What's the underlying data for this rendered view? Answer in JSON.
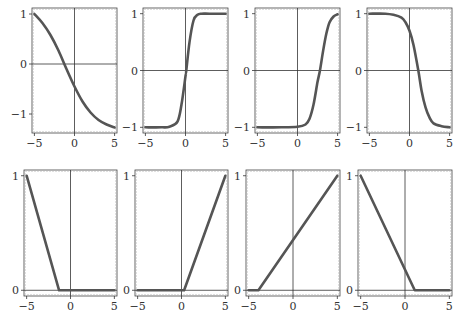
{
  "figure": {
    "rows": 2,
    "cols": 4,
    "line_color": "#555555",
    "axis_color": "#333333",
    "frame_color": "#444444"
  },
  "chart_data": [
    {
      "type": "line",
      "panel": "row1-col1",
      "title": "",
      "xlabel": "",
      "ylabel": "",
      "xlim": [
        -5.3,
        5.3
      ],
      "ylim": [
        -1.38,
        1.12
      ],
      "xticks": [
        -5,
        0,
        5
      ],
      "xtick_labels": [
        "−5",
        "0",
        "5"
      ],
      "yticks": [
        -1,
        0,
        1
      ],
      "ytick_labels": [
        "−1",
        "0",
        "1"
      ],
      "grid": false,
      "x": [
        -5,
        -4,
        -3,
        -2,
        -1,
        0,
        1,
        2,
        3,
        4,
        5
      ],
      "y": [
        1.0,
        0.82,
        0.58,
        0.27,
        -0.1,
        -0.45,
        -0.75,
        -0.97,
        -1.12,
        -1.21,
        -1.27
      ]
    },
    {
      "type": "line",
      "panel": "row1-col2",
      "xlim": [
        -5.3,
        5.3
      ],
      "ylim": [
        -1.1,
        1.1
      ],
      "xticks": [
        -5,
        0,
        5
      ],
      "xtick_labels": [
        "−5",
        "0",
        "5"
      ],
      "yticks": [
        -1,
        0,
        1
      ],
      "ytick_labels": [
        "−1",
        "0",
        "1"
      ],
      "grid": false,
      "x": [
        -5,
        -3,
        -2,
        -1,
        -0.5,
        0,
        0.1,
        0.5,
        1,
        1.5,
        2,
        3,
        5
      ],
      "y": [
        -1.0,
        -1.0,
        -0.99,
        -0.9,
        -0.6,
        -0.1,
        0.0,
        0.5,
        0.88,
        0.98,
        1.0,
        1.0,
        1.0
      ]
    },
    {
      "type": "line",
      "panel": "row1-col3",
      "xlim": [
        -5.3,
        5.3
      ],
      "ylim": [
        -1.1,
        1.1
      ],
      "xticks": [
        -5,
        0,
        5
      ],
      "xtick_labels": [
        "−5",
        "0",
        "5"
      ],
      "yticks": [
        -1,
        0,
        1
      ],
      "ytick_labels": [
        "−1",
        "0",
        "1"
      ],
      "grid": false,
      "x": [
        -5,
        -2,
        0,
        1,
        1.5,
        2,
        2.5,
        2.8,
        3.2,
        3.6,
        4,
        4.5,
        5
      ],
      "y": [
        -1.0,
        -1.0,
        -0.99,
        -0.95,
        -0.85,
        -0.6,
        -0.2,
        0.0,
        0.35,
        0.65,
        0.85,
        0.95,
        0.99
      ]
    },
    {
      "type": "line",
      "panel": "row1-col4",
      "xlim": [
        -5.3,
        5.3
      ],
      "ylim": [
        -1.1,
        1.1
      ],
      "xticks": [
        -5,
        0,
        5
      ],
      "xtick_labels": [
        "−5",
        "0",
        "5"
      ],
      "yticks": [
        -1,
        0,
        1
      ],
      "ytick_labels": [
        "−1",
        "0",
        "1"
      ],
      "grid": false,
      "x": [
        -5,
        -3,
        -2,
        -1,
        -0.5,
        0,
        0.5,
        1.1,
        1.5,
        2,
        2.5,
        3,
        4,
        5
      ],
      "y": [
        1.0,
        1.0,
        0.98,
        0.93,
        0.85,
        0.7,
        0.45,
        0.0,
        -0.35,
        -0.65,
        -0.83,
        -0.93,
        -0.98,
        -1.0
      ]
    },
    {
      "type": "line",
      "panel": "row2-col1",
      "xlim": [
        -5.3,
        5.3
      ],
      "ylim": [
        -0.05,
        1.05
      ],
      "xticks": [
        -5,
        0,
        5
      ],
      "xtick_labels": [
        "−5",
        "0",
        "5"
      ],
      "yticks": [
        0,
        1
      ],
      "ytick_labels": [
        "0",
        "1"
      ],
      "grid": false,
      "x": [
        -5,
        -1.3,
        5
      ],
      "y": [
        1.0,
        0.0,
        0.0
      ]
    },
    {
      "type": "line",
      "panel": "row2-col2",
      "xlim": [
        -5.3,
        5.3
      ],
      "ylim": [
        -0.05,
        1.05
      ],
      "xticks": [
        -5,
        0,
        5
      ],
      "xtick_labels": [
        "−5",
        "0",
        "5"
      ],
      "yticks": [
        0,
        1
      ],
      "ytick_labels": [
        "0",
        "1"
      ],
      "grid": false,
      "x": [
        -5,
        0.3,
        5
      ],
      "y": [
        0.0,
        0.0,
        1.0
      ]
    },
    {
      "type": "line",
      "panel": "row2-col3",
      "xlim": [
        -5.3,
        5.3
      ],
      "ylim": [
        -0.05,
        1.05
      ],
      "xticks": [
        -5,
        0,
        5
      ],
      "xtick_labels": [
        "−5",
        "0",
        "5"
      ],
      "yticks": [
        0,
        1
      ],
      "ytick_labels": [
        "0",
        "1"
      ],
      "grid": false,
      "x": [
        -5,
        -3.9,
        5
      ],
      "y": [
        0.0,
        0.0,
        1.0
      ]
    },
    {
      "type": "line",
      "panel": "row2-col4",
      "xlim": [
        -5.3,
        5.3
      ],
      "ylim": [
        -0.05,
        1.05
      ],
      "xticks": [
        -5,
        0,
        5
      ],
      "xtick_labels": [
        "−5",
        "0",
        "5"
      ],
      "yticks": [
        0,
        1
      ],
      "ytick_labels": [
        "0",
        "1"
      ],
      "grid": false,
      "x": [
        -5,
        1.1,
        5
      ],
      "y": [
        1.0,
        0.0,
        0.0
      ]
    }
  ],
  "layout": {
    "panels": [
      {
        "left": 32,
        "top": 8,
        "right": 117,
        "bottom": 133
      },
      {
        "left": 143,
        "top": 8,
        "right": 228,
        "bottom": 133
      },
      {
        "left": 255,
        "top": 8,
        "right": 340,
        "bottom": 133
      },
      {
        "left": 367,
        "top": 8,
        "right": 452,
        "bottom": 133
      },
      {
        "left": 24,
        "top": 170,
        "right": 117,
        "bottom": 296
      },
      {
        "left": 135,
        "top": 170,
        "right": 228,
        "bottom": 296
      },
      {
        "left": 246,
        "top": 170,
        "right": 340,
        "bottom": 296
      },
      {
        "left": 358,
        "top": 170,
        "right": 452,
        "bottom": 296
      }
    ]
  }
}
